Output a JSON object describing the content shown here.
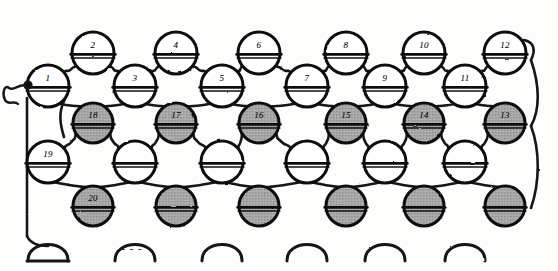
{
  "figure": {
    "kind": "hand-drawn stitch chart",
    "background_color": "#fdfdfc",
    "ink_color": "#111111",
    "shaded_stitch_color": "#a8a8a8",
    "open_stitch_color": "#ffffff",
    "columns": 6,
    "rows": 5
  },
  "rows": [
    {
      "id": "row-top-even",
      "kind": "open",
      "y": 53,
      "labels": [
        "2",
        "4",
        "6",
        "8",
        "10",
        "12"
      ]
    },
    {
      "id": "row-second-odd",
      "kind": "open",
      "y": 86,
      "labels": [
        "1",
        "3",
        "5",
        "7",
        "9",
        "11"
      ]
    },
    {
      "id": "row-third-shaded",
      "kind": "shaded",
      "y": 123,
      "labels": [
        "18",
        "17",
        "16",
        "15",
        "14",
        "13"
      ]
    },
    {
      "id": "row-fourth-open",
      "kind": "open",
      "y": 162,
      "labels": [
        "19",
        "",
        "",
        "",
        "",
        ""
      ]
    },
    {
      "id": "row-fifth-shaded",
      "kind": "shaded",
      "y": 206,
      "labels": [
        "20",
        "",
        "",
        "",
        "",
        ""
      ]
    }
  ],
  "columns_x": {
    "odd": [
      48,
      135,
      222,
      307,
      385,
      465
    ],
    "even": [
      93,
      176,
      259,
      346,
      424,
      505
    ]
  },
  "bottom_arcs": {
    "count": 6,
    "y": 245,
    "x": [
      48,
      135,
      222,
      307,
      385,
      465
    ],
    "note": "open loop arcs along cast-on edge"
  },
  "yarn_tail": {
    "present": true,
    "side": "left",
    "description": "wavy yarn tail with knot entering stitch 1"
  },
  "dashes": {
    "present": true,
    "x": 130,
    "y": 246,
    "glyph": "- - -"
  },
  "legend": {
    "shaded_meaning": "contrast / second colour stitch",
    "open_meaning": "main colour stitch"
  }
}
